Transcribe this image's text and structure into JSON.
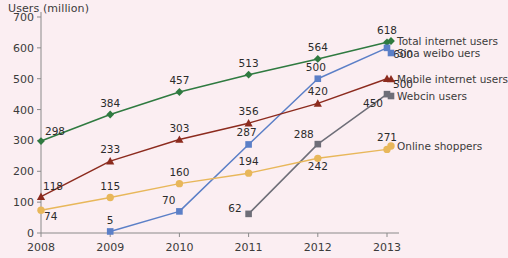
{
  "chart_data": {
    "type": "line",
    "title": "Users (million)",
    "xlabel": "",
    "ylabel": "Users (million)",
    "categories": [
      "2008",
      "2009",
      "2010",
      "2011",
      "2012",
      "2013"
    ],
    "x": [
      2008,
      2009,
      2010,
      2011,
      2012,
      2013
    ],
    "ylim": [
      0,
      700
    ],
    "yticks": [
      0,
      100,
      200,
      300,
      400,
      500,
      600,
      700
    ],
    "ytick_labels": [
      "0",
      "100",
      "200",
      "300",
      "400",
      "500",
      "600",
      "700"
    ],
    "grid": false,
    "legend_position": "right",
    "background_color": "#fbeef2",
    "series": [
      {
        "name": "Total internet users",
        "color": "#2f7a40",
        "marker": "diamond",
        "values": [
          298,
          384,
          457,
          513,
          564,
          618
        ],
        "labels": [
          "298",
          "384",
          "457",
          "513",
          "564",
          "618"
        ]
      },
      {
        "name": "Sina weibo uers",
        "color": "#5b7fc7",
        "marker": "square",
        "values": [
          null,
          5,
          70,
          287,
          500,
          600
        ],
        "labels": [
          "",
          "5",
          "70",
          "287",
          "500",
          "600"
        ]
      },
      {
        "name": "Mobile internet users",
        "color": "#8c2b1e",
        "marker": "triangle",
        "values": [
          118,
          233,
          303,
          356,
          420,
          500
        ],
        "labels": [
          "118",
          "233",
          "303",
          "356",
          "420",
          "500"
        ]
      },
      {
        "name": "Webcin users",
        "color": "#6e6e78",
        "marker": "square",
        "values": [
          null,
          null,
          null,
          62,
          288,
          450
        ],
        "labels": [
          "",
          "",
          "",
          "62",
          "288",
          "450"
        ]
      },
      {
        "name": "Online shoppers",
        "color": "#e8b75a",
        "marker": "circle",
        "values": [
          74,
          115,
          160,
          194,
          242,
          271
        ],
        "labels": [
          "74",
          "115",
          "160",
          "194",
          "242",
          "271"
        ]
      }
    ]
  },
  "legend": {
    "entries": [
      {
        "label": "Total internet users"
      },
      {
        "label": "Sina weibo uers"
      },
      {
        "label": "Mobile internet users"
      },
      {
        "label": "Webcin users"
      },
      {
        "label": "Online shoppers"
      }
    ]
  }
}
